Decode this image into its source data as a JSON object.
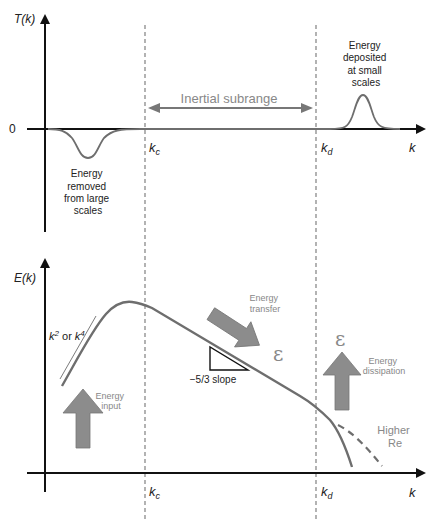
{
  "top_panel": {
    "y_axis_label": "T(k)",
    "zero_label": "0",
    "x_axis_label": "k",
    "kc_label": "k",
    "kc_sub": "c",
    "kd_label": "k",
    "kd_sub": "d",
    "inertial_label": "Inertial subrange",
    "removed_lines": [
      "Energy",
      "removed",
      "from large",
      "scales"
    ],
    "deposited_lines": [
      "Energy",
      "deposited",
      "at small",
      "scales"
    ]
  },
  "bottom_panel": {
    "y_axis_label": "E(k)",
    "x_axis_label": "k",
    "kc_label": "k",
    "kc_sub": "c",
    "kd_label": "k",
    "kd_sub": "d",
    "power_law": {
      "k": "k",
      "exp1": "2",
      "or": " or ",
      "k2": "k",
      "exp2": "4"
    },
    "energy_input_lines": [
      "Energy",
      "input"
    ],
    "energy_transfer_lines": [
      "Energy",
      "transfer"
    ],
    "epsilon": "ε",
    "slope_label": "−5/3 slope",
    "dissipation_lines": [
      "Energy",
      "dissipation"
    ],
    "higher_re_lines": [
      "Higher",
      "Re"
    ]
  },
  "colors": {
    "axis": "#111111",
    "curve": "#6e6e6e",
    "arrow_fill": "#8c8c8c",
    "dashed": "#8a8a8a",
    "faint_text": "#8a8a8a"
  }
}
